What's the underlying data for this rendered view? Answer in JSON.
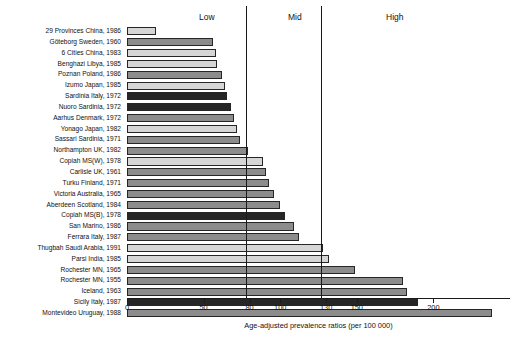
{
  "chart_data": {
    "type": "bar",
    "orientation": "horizontal",
    "title": "",
    "xlabel": "Age-adjusted prevalence ratios (per 100 000)",
    "ylabel": "",
    "xlim": [
      0,
      250
    ],
    "grid": false,
    "legend": null,
    "xticks": [
      0,
      50,
      80,
      100,
      130,
      150,
      200
    ],
    "xtick_labels": [
      "0",
      "50",
      "80",
      "100",
      "130",
      "150",
      "200"
    ],
    "reference_lines": [
      80,
      130
    ],
    "band_labels": [
      {
        "text": "Low",
        "at": 45
      },
      {
        "text": "Mid",
        "at": 105
      },
      {
        "text": "High",
        "at": 170
      }
    ],
    "categories": [
      "29 Provinces China, 1986",
      "Göteborg Sweden, 1960",
      "6 Cities China, 1983",
      "Benghazi Libya, 1985",
      "Poznan Poland, 1986",
      "Izumo Japan, 1985",
      "Sardinia Italy, 1972",
      "Nuoro Sardinia, 1972",
      "Aarhus Denmark, 1972",
      "Yonago Japan, 1982",
      "Sassari Sardinia, 1971",
      "Northampton UK, 1982",
      "Copiah MS(W), 1978",
      "Carlisle UK, 1961",
      "Turku Finland, 1971",
      "Victoria Australia, 1965",
      "Aberdeen Scotland, 1984",
      "Copiah MS(B), 1978",
      "San Marino, 1986",
      "Ferrara Italy, 1987",
      "Thugbah Saudi Arabia, 1991",
      "Parsi India, 1985",
      "Rochester MN, 1965",
      "Rochester MN, 1955",
      "Iceland, 1963",
      "Sicily Italy, 1987",
      "Montevideo Uruguay, 1988"
    ],
    "values": [
      19,
      56,
      58,
      59,
      62,
      64,
      65,
      68,
      70,
      72,
      74,
      79,
      89,
      91,
      93,
      96,
      100,
      103,
      109,
      112,
      128,
      132,
      149,
      180,
      183,
      190,
      238
    ],
    "shades": [
      "light",
      "mid",
      "light",
      "light",
      "mid",
      "light",
      "dark",
      "dark",
      "mid",
      "light",
      "mid",
      "mid",
      "light",
      "mid",
      "mid",
      "mid",
      "mid",
      "dark",
      "mid",
      "mid",
      "light",
      "light",
      "mid",
      "mid",
      "mid",
      "dark",
      "mid"
    ],
    "shade_colors": {
      "light": "#d6d6d6",
      "mid": "#8c8c8c",
      "dark": "#262626"
    },
    "bar_edge_color": "#262626",
    "axis_color": "#1a1a1a",
    "background": "#ffffff"
  }
}
